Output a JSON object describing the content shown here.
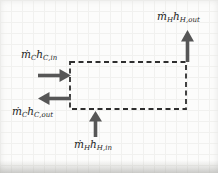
{
  "diagram": {
    "kind": "control-volume flow diagram",
    "boundary": {
      "style": "dashed-rectangle"
    },
    "streams": {
      "hot_out": {
        "mdot": "ṁ",
        "mdot_sub": "H",
        "h": "h",
        "h_sub": "H,out",
        "direction": "up",
        "crosses": "right-top-corner"
      },
      "cold_in": {
        "mdot": "ṁ",
        "mdot_sub": "C",
        "h": "h",
        "h_sub": "C,in",
        "direction": "right",
        "crosses": "left-edge"
      },
      "cold_out": {
        "mdot": "ṁ",
        "mdot_sub": "C",
        "h": "h",
        "h_sub": "C,out",
        "direction": "left",
        "crosses": "left-edge"
      },
      "hot_in": {
        "mdot": "ṁ",
        "mdot_sub": "H",
        "h": "h",
        "h_sub": "H,in",
        "direction": "up",
        "crosses": "bottom-edge"
      }
    }
  },
  "colors": {
    "paper": "#fcfcfb",
    "grid": "#e9e9e6",
    "boundary": "#2e2e2e",
    "arrow": "#565656",
    "ink": "#1e1e1e"
  }
}
